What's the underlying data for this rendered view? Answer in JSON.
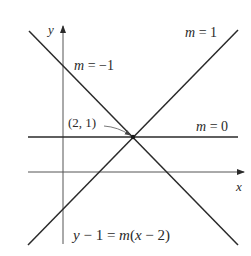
{
  "diagram": {
    "type": "coordinate-plot",
    "axes": {
      "x_label": "x",
      "y_label": "y"
    },
    "point": {
      "label": "(2, 1)",
      "x": 2,
      "y": 1
    },
    "lines": [
      {
        "slope_label": "m = 1",
        "slope": 1
      },
      {
        "slope_label": "m = −1",
        "slope": -1
      },
      {
        "slope_label": "m = 0",
        "slope": 0
      }
    ],
    "equation": "y − 1 = m(x − 2)",
    "colors": {
      "line": "#2a2a2a",
      "axis": "#555555",
      "background": "#ffffff"
    }
  }
}
